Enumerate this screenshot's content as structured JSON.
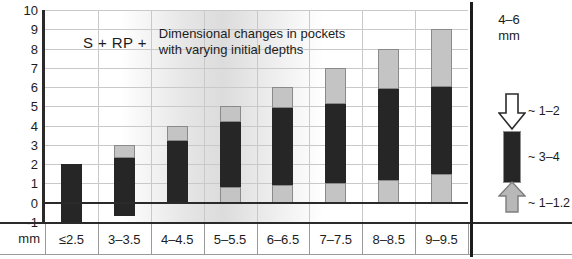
{
  "chart_data": {
    "type": "bar",
    "title": "Dimensional changes in pockets with varying initial depths",
    "title_prefix": "S + RP +",
    "title_line1": "Dimensional changes in pockets",
    "title_line2": "with varying initial depths",
    "xlabel": "",
    "ylabel": "mm",
    "ylim": [
      -1,
      10
    ],
    "ytick_values": [
      10,
      9,
      8,
      7,
      6,
      5,
      4,
      3,
      2,
      1,
      0,
      -1
    ],
    "yticks": [
      "10",
      "9",
      "8",
      "7",
      "6",
      "5",
      "4",
      "3",
      "2",
      "1",
      "0",
      "-1"
    ],
    "y_unit": "mm",
    "grid": true,
    "legend_position": "right-panel",
    "categories": [
      "≤2.5",
      "3–3.5",
      "4–4.5",
      "5–5.5",
      "6–6.5",
      "7–7.5",
      "8–8.5",
      "9–9.5"
    ],
    "series": [
      {
        "name": "gingival recession (lower light segment)",
        "color": "#c4c4c4",
        "values": [
          0,
          0,
          0,
          0.8,
          0.9,
          1.0,
          1.2,
          1.5
        ]
      },
      {
        "name": "probing depth (dark segment)",
        "color": "#262626",
        "values": [
          3.0,
          3.0,
          3.2,
          3.4,
          4.0,
          4.1,
          4.7,
          4.5
        ]
      },
      {
        "name": "attachment gain (upper light segment)",
        "color": "#c4c4c4",
        "values": [
          0,
          0.7,
          0.8,
          0.8,
          1.1,
          1.9,
          2.1,
          3.0
        ]
      }
    ],
    "bars": [
      {
        "category": "≤2.5",
        "bottom": -1.0,
        "total_top": 2.0,
        "lower_light_top": -1.0,
        "dark_top": 2.0,
        "upper_light_top": 2.0
      },
      {
        "category": "3–3.5",
        "bottom": -0.7,
        "total_top": 3.0,
        "lower_light_top": -0.7,
        "dark_top": 2.3,
        "upper_light_top": 3.0
      },
      {
        "category": "4–4.5",
        "bottom": -0.05,
        "total_top": 4.0,
        "lower_light_top": -0.05,
        "dark_top": 3.2,
        "upper_light_top": 4.0
      },
      {
        "category": "5–5.5",
        "bottom": 0.0,
        "total_top": 5.0,
        "lower_light_top": 0.8,
        "dark_top": 4.2,
        "upper_light_top": 5.0
      },
      {
        "category": "6–6.5",
        "bottom": 0.0,
        "total_top": 6.0,
        "lower_light_top": 0.9,
        "dark_top": 4.9,
        "upper_light_top": 6.0
      },
      {
        "category": "7–7.5",
        "bottom": 0.0,
        "total_top": 7.0,
        "lower_light_top": 1.0,
        "dark_top": 5.1,
        "upper_light_top": 7.0
      },
      {
        "category": "8–8.5",
        "bottom": 0.0,
        "total_top": 8.0,
        "lower_light_top": 1.2,
        "dark_top": 5.9,
        "upper_light_top": 8.0
      },
      {
        "category": "9–9.5",
        "bottom": 0.0,
        "total_top": 9.0,
        "lower_light_top": 1.5,
        "dark_top": 6.0,
        "upper_light_top": 9.0
      }
    ],
    "annotations": [
      {
        "text": "4–6 mm",
        "position": "legend-top"
      },
      {
        "text": "~ 1–2",
        "position": "legend-arrow-down"
      },
      {
        "text": "~ 3–4",
        "position": "legend-dark-bar"
      },
      {
        "text": "~ 1–1.2",
        "position": "legend-arrow-up"
      }
    ]
  },
  "legend": {
    "title_line1": "4–6",
    "title_line2": "mm",
    "arrow_down_label": "~ 1–2",
    "dark_bar_label": "~ 3–4",
    "arrow_up_label": "~ 1–1.2",
    "arrow_down_color": "#ffffff",
    "dark_bar_color": "#262626",
    "arrow_up_color": "#b8b8b8"
  },
  "axes": {
    "y_unit": "mm",
    "yticks": [
      "10",
      "9",
      "8",
      "7",
      "6",
      "5",
      "4",
      "3",
      "2",
      "1",
      "0",
      "-1"
    ],
    "xticks": [
      "≤2.5",
      "3–3.5",
      "4–4.5",
      "5–5.5",
      "6–6.5",
      "7–7.5",
      "8–8.5",
      "9–9.5"
    ]
  },
  "title": {
    "prefix": "S + RP +",
    "line1": "Dimensional changes in pockets",
    "line2": "with varying initial depths"
  }
}
